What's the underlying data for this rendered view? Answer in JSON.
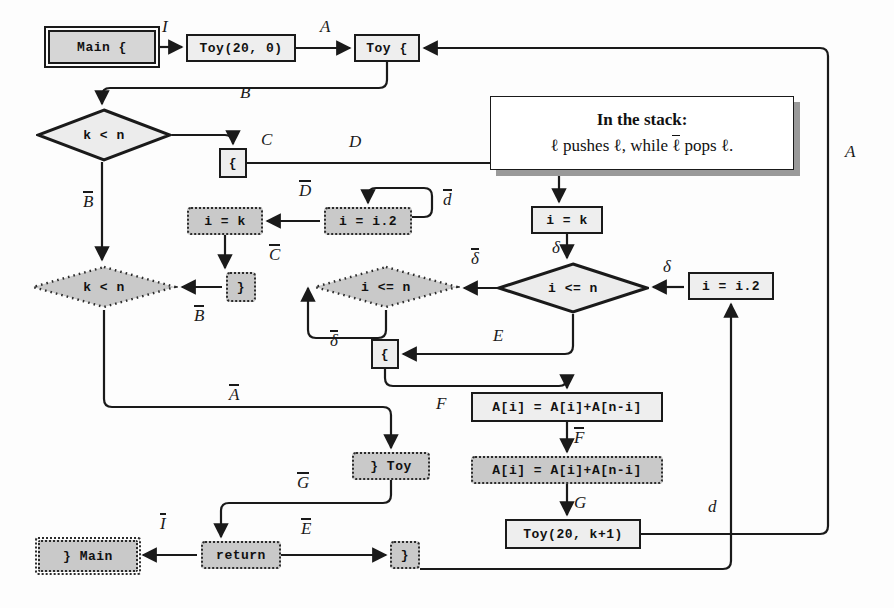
{
  "diagram": {
    "legend": {
      "line1": "In the stack:",
      "line2_prefix": "ℓ pushes ℓ, while ",
      "line2_bar": "ℓ",
      "line2_suffix": " pops ℓ."
    },
    "nodes": [
      {
        "id": "main_open",
        "label": "Main {",
        "shape": "rect-double",
        "x": 48,
        "y": 30,
        "w": 108,
        "h": 34
      },
      {
        "id": "toy_call_0",
        "label": "Toy(20, 0)",
        "shape": "rect-solid",
        "x": 186,
        "y": 34,
        "w": 110,
        "h": 28
      },
      {
        "id": "toy_open",
        "label": "Toy {",
        "shape": "rect-solid",
        "x": 354,
        "y": 34,
        "w": 66,
        "h": 28
      },
      {
        "id": "brace_c",
        "label": "{",
        "shape": "rect-solid",
        "x": 219,
        "y": 148,
        "w": 28,
        "h": 30
      },
      {
        "id": "i_eq_k_d",
        "label": "i = k",
        "shape": "rect-dotted",
        "x": 187,
        "y": 207,
        "w": 76,
        "h": 28
      },
      {
        "id": "i_eq_i2_d",
        "label": "i = i.2",
        "shape": "rect-dotted",
        "x": 324,
        "y": 207,
        "w": 88,
        "h": 28
      },
      {
        "id": "i_eq_k_s",
        "label": "i = k",
        "shape": "rect-solid",
        "x": 531,
        "y": 206,
        "w": 72,
        "h": 28
      },
      {
        "id": "brace_close_d",
        "label": "}",
        "shape": "rect-dotted",
        "x": 226,
        "y": 272,
        "w": 30,
        "h": 30
      },
      {
        "id": "i_eq_i2_s",
        "label": "i = i.2",
        "shape": "rect-solid",
        "x": 688,
        "y": 272,
        "w": 86,
        "h": 28
      },
      {
        "id": "brace_e",
        "label": "{",
        "shape": "rect-solid",
        "x": 371,
        "y": 339,
        "w": 28,
        "h": 30
      },
      {
        "id": "assign_s",
        "label": "A[i] = A[i]+A[n-i]",
        "shape": "rect-solid",
        "x": 471,
        "y": 392,
        "w": 192,
        "h": 30
      },
      {
        "id": "assign_d",
        "label": "A[i] = A[i]+A[n-i]",
        "shape": "rect-dotted",
        "x": 471,
        "y": 456,
        "w": 192,
        "h": 28
      },
      {
        "id": "toy_close_d",
        "label": "} Toy",
        "shape": "rect-dotted",
        "x": 352,
        "y": 452,
        "w": 78,
        "h": 28
      },
      {
        "id": "toy_call_k1",
        "label": "Toy(20, k+1)",
        "shape": "rect-solid",
        "x": 505,
        "y": 519,
        "w": 136,
        "h": 30
      },
      {
        "id": "main_close_d",
        "label": "} Main",
        "shape": "rect-dotted-double",
        "x": 38,
        "y": 540,
        "w": 100,
        "h": 32
      },
      {
        "id": "return_d",
        "label": "return",
        "shape": "rect-dotted",
        "x": 201,
        "y": 541,
        "w": 80,
        "h": 28
      },
      {
        "id": "brace_close2_d",
        "label": "}",
        "shape": "rect-dotted",
        "x": 390,
        "y": 541,
        "w": 30,
        "h": 28
      }
    ],
    "diamonds": [
      {
        "id": "k_lt_n_solid",
        "label": "k < n",
        "style": "solid",
        "x": 36,
        "y": 108,
        "w": 136,
        "h": 54
      },
      {
        "id": "k_lt_n_dotted",
        "label": "k < n",
        "style": "dotted",
        "x": 30,
        "y": 264,
        "w": 148,
        "h": 46
      },
      {
        "id": "i_le_n_dotted",
        "label": "i <= n",
        "style": "dotted",
        "x": 312,
        "y": 264,
        "w": 148,
        "h": 46
      },
      {
        "id": "i_le_n_solid",
        "label": "i <= n",
        "style": "solid",
        "x": 497,
        "y": 262,
        "w": 152,
        "h": 52
      }
    ],
    "edge_labels": [
      {
        "id": "lbl-I",
        "text": "I",
        "bar": false,
        "x": 162,
        "y": 18
      },
      {
        "id": "lbl-A-top",
        "text": "A",
        "bar": false,
        "x": 320,
        "y": 18
      },
      {
        "id": "lbl-B",
        "text": "B",
        "bar": false,
        "x": 240,
        "y": 84
      },
      {
        "id": "lbl-C",
        "text": "C",
        "bar": false,
        "x": 261,
        "y": 131
      },
      {
        "id": "lbl-D",
        "text": "D",
        "bar": false,
        "x": 349,
        "y": 133
      },
      {
        "id": "lbl-Dbar",
        "text": "D",
        "bar": true,
        "x": 299,
        "y": 181
      },
      {
        "id": "lbl-dbar",
        "text": "d",
        "bar": true,
        "x": 443,
        "y": 190
      },
      {
        "id": "lbl-Bbar-1",
        "text": "B",
        "bar": true,
        "x": 83,
        "y": 192
      },
      {
        "id": "lbl-Cbar",
        "text": "C",
        "bar": true,
        "x": 269,
        "y": 245
      },
      {
        "id": "lbl-delta1",
        "text": "δ",
        "bar": false,
        "x": 552,
        "y": 239
      },
      {
        "id": "lbl-deltabar1",
        "text": "δ",
        "bar": true,
        "x": 471,
        "y": 249
      },
      {
        "id": "lbl-delta2",
        "text": "δ",
        "bar": false,
        "x": 663,
        "y": 258
      },
      {
        "id": "lbl-Bbar-2",
        "text": "B",
        "bar": true,
        "x": 194,
        "y": 306
      },
      {
        "id": "lbl-deltabar2",
        "text": "δ",
        "bar": true,
        "x": 330,
        "y": 331
      },
      {
        "id": "lbl-E",
        "text": "E",
        "bar": false,
        "x": 493,
        "y": 327
      },
      {
        "id": "lbl-Abar",
        "text": "A",
        "bar": true,
        "x": 229,
        "y": 385
      },
      {
        "id": "lbl-F",
        "text": "F",
        "bar": false,
        "x": 436,
        "y": 395
      },
      {
        "id": "lbl-Fbar",
        "text": "F",
        "bar": true,
        "x": 574,
        "y": 428
      },
      {
        "id": "lbl-G",
        "text": "G",
        "bar": false,
        "x": 574,
        "y": 494
      },
      {
        "id": "lbl-Gbar",
        "text": "G",
        "bar": true,
        "x": 297,
        "y": 473
      },
      {
        "id": "lbl-Ebar",
        "text": "E",
        "bar": true,
        "x": 301,
        "y": 519
      },
      {
        "id": "lbl-Ibar",
        "text": "I",
        "bar": true,
        "x": 160,
        "y": 514
      },
      {
        "id": "lbl-d",
        "text": "d",
        "bar": false,
        "x": 708,
        "y": 498
      },
      {
        "id": "lbl-A-right",
        "text": "A",
        "bar": false,
        "x": 845,
        "y": 143
      }
    ]
  }
}
